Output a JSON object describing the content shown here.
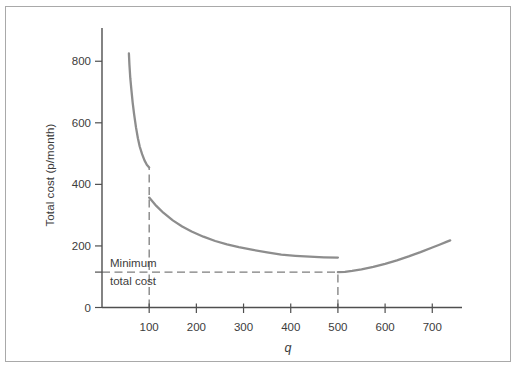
{
  "chart_data": {
    "type": "line",
    "title": "",
    "xlabel": "q",
    "ylabel": "Total cost (p/month)",
    "xlim": [
      0,
      763
    ],
    "ylim": [
      0,
      908
    ],
    "xticks": [
      100,
      200,
      300,
      400,
      500,
      600,
      700
    ],
    "yticks": [
      0,
      200,
      400,
      600,
      800
    ],
    "extra_yticks": [
      115
    ],
    "grid": false,
    "legend": "none",
    "series": [
      {
        "name": "total-cost-segment-1",
        "points": [
          [
            57,
            825
          ],
          [
            58,
            790
          ],
          [
            60,
            745
          ],
          [
            62,
            710
          ],
          [
            65,
            665
          ],
          [
            68,
            628
          ],
          [
            72,
            585
          ],
          [
            76,
            550
          ],
          [
            80,
            523
          ],
          [
            85,
            498
          ],
          [
            90,
            478
          ],
          [
            95,
            464
          ],
          [
            100,
            455
          ]
        ]
      },
      {
        "name": "total-cost-segment-2",
        "points": [
          [
            100,
            357
          ],
          [
            115,
            330
          ],
          [
            130,
            308
          ],
          [
            150,
            283
          ],
          [
            170,
            263
          ],
          [
            190,
            247
          ],
          [
            215,
            230
          ],
          [
            240,
            216
          ],
          [
            265,
            205
          ],
          [
            290,
            196
          ],
          [
            320,
            187
          ],
          [
            350,
            179
          ],
          [
            380,
            172
          ],
          [
            410,
            168
          ],
          [
            440,
            165
          ],
          [
            470,
            163
          ],
          [
            500,
            162
          ]
        ]
      },
      {
        "name": "total-cost-segment-3",
        "points": [
          [
            500,
            115
          ],
          [
            515,
            116
          ],
          [
            530,
            119
          ],
          [
            550,
            124
          ],
          [
            575,
            132
          ],
          [
            600,
            142
          ],
          [
            625,
            153
          ],
          [
            650,
            166
          ],
          [
            675,
            180
          ],
          [
            700,
            195
          ],
          [
            715,
            204
          ],
          [
            730,
            213
          ],
          [
            738,
            218
          ]
        ]
      }
    ],
    "guides": [
      {
        "name": "q100-vertical-guide",
        "type": "v",
        "x": 100,
        "y0": 0,
        "y1": 455
      },
      {
        "name": "q500-vertical-guide",
        "type": "v",
        "x": 500,
        "y0": 0,
        "y1": 115
      },
      {
        "name": "minimum-cost-horizontal-guide",
        "type": "h",
        "y": 115,
        "x0": 0,
        "x1": 500
      }
    ],
    "annotation": {
      "line1": "Minimum",
      "line2": "total cost",
      "value": 115
    },
    "colors": {
      "curve": "#8d8d8d",
      "axis": "#4f4f4f",
      "dashed": "#7d7d7d",
      "text": "#3c3c3c",
      "frame_border": "#a9a9a9",
      "background": "#ffffff"
    }
  }
}
